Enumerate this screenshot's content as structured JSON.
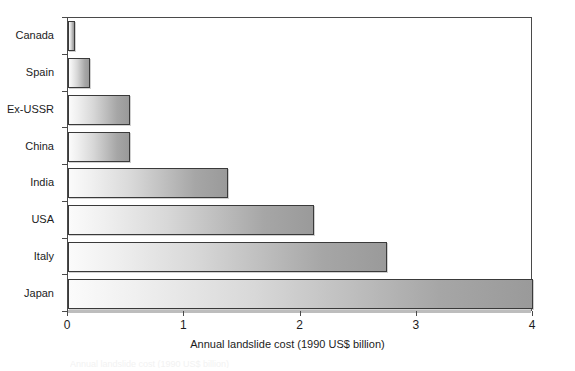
{
  "chart_data": {
    "type": "bar",
    "orientation": "horizontal",
    "title": "",
    "xlabel": "Annual landslide cost (1990 US$ billion)",
    "ylabel": "",
    "categories": [
      "Canada",
      "Spain",
      "Ex-USSR",
      "China",
      "India",
      "USA",
      "Italy",
      "Japan"
    ],
    "values": [
      0.06,
      0.19,
      0.53,
      0.53,
      1.38,
      2.12,
      2.74,
      4.0
    ],
    "xlim": [
      0,
      4
    ],
    "xticks": [
      0,
      1,
      2,
      3,
      4
    ],
    "xtick_labels": [
      "0",
      "1",
      "2",
      "3",
      "4"
    ],
    "grid": false,
    "legend": false,
    "series": [
      {
        "name": "Annual landslide cost",
        "values": [
          0.06,
          0.19,
          0.53,
          0.53,
          1.38,
          2.12,
          2.74,
          4.0
        ]
      }
    ],
    "bar_fill": "gradient-light-to-dark-gray",
    "colors": {
      "bar_gradient_start": "#fbfbfb",
      "bar_gradient_end": "#9a9a9a",
      "bar_border": "#3a3a3a",
      "axis": "#4a4a4a",
      "text": "#1c1c1c",
      "background": "#ffffff"
    }
  },
  "caption_remnant": "Annual landslide cost (1990 US$ billion)"
}
